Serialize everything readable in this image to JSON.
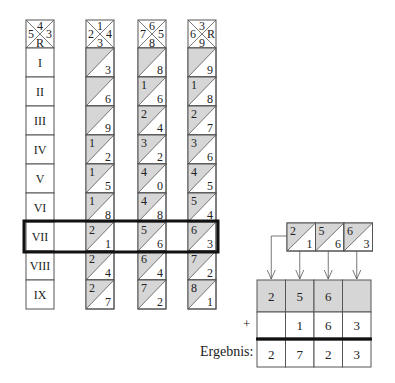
{
  "label_rod": {
    "header": {
      "top": "4",
      "left": "5",
      "right": "3",
      "bottom": "R"
    },
    "rows": [
      "I",
      "II",
      "III",
      "IV",
      "V",
      "VI",
      "VII",
      "VIII",
      "IX"
    ]
  },
  "rods": [
    {
      "header": {
        "top": "1",
        "left": "2",
        "right": "4",
        "bottom": "3"
      },
      "cells": [
        [
          "",
          "3"
        ],
        [
          "",
          "6"
        ],
        [
          "",
          "9"
        ],
        [
          "1",
          "2"
        ],
        [
          "1",
          "5"
        ],
        [
          "1",
          "8"
        ],
        [
          "2",
          "1"
        ],
        [
          "2",
          "4"
        ],
        [
          "2",
          "7"
        ]
      ]
    },
    {
      "header": {
        "top": "6",
        "left": "7",
        "right": "5",
        "bottom": "8"
      },
      "cells": [
        [
          "",
          "8"
        ],
        [
          "1",
          "6"
        ],
        [
          "2",
          "4"
        ],
        [
          "3",
          "2"
        ],
        [
          "4",
          "0"
        ],
        [
          "4",
          "8"
        ],
        [
          "5",
          "6"
        ],
        [
          "6",
          "4"
        ],
        [
          "7",
          "2"
        ]
      ]
    },
    {
      "header": {
        "top": "3",
        "left": "6",
        "right": "R",
        "bottom": "9"
      },
      "cells": [
        [
          "",
          "9"
        ],
        [
          "1",
          "8"
        ],
        [
          "2",
          "7"
        ],
        [
          "3",
          "6"
        ],
        [
          "4",
          "5"
        ],
        [
          "5",
          "4"
        ],
        [
          "6",
          "3"
        ],
        [
          "7",
          "2"
        ],
        [
          "8",
          "1"
        ]
      ]
    }
  ],
  "highlighted_row": "VII",
  "extracted_row": [
    [
      "2",
      "1"
    ],
    [
      "5",
      "6"
    ],
    [
      "6",
      "3"
    ]
  ],
  "addition": {
    "row_tens": [
      "2",
      "5",
      "6",
      ""
    ],
    "plus_sign": "+",
    "row_units": [
      "",
      "1",
      "6",
      "3"
    ],
    "result_label": "Ergebnis:",
    "result": [
      "2",
      "7",
      "2",
      "3"
    ]
  },
  "colors": {
    "shade": "#d6d6d6",
    "line": "#555555",
    "thick": "#111111"
  }
}
